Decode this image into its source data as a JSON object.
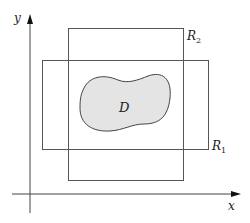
{
  "diagram": {
    "axes": {
      "x_label": "x",
      "y_label": "y"
    },
    "rectangles": [
      {
        "label": "R",
        "subscript": "1"
      },
      {
        "label": "R",
        "subscript": "2"
      }
    ],
    "region": {
      "label": "D",
      "fill_color": "#e4e4e4",
      "stroke_color": "#444444"
    },
    "line_color": "#555555"
  }
}
